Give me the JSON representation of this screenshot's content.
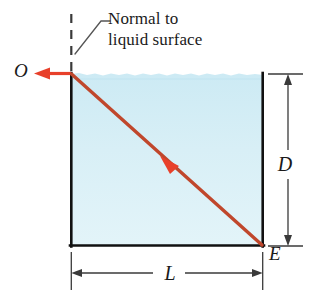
{
  "figure": {
    "annotation": {
      "line1": "Normal to",
      "line2": "liquid surface"
    },
    "points": {
      "origin_label": "O",
      "bottom_corner_label": "E"
    },
    "dimensions": {
      "depth_label": "D",
      "length_label": "L"
    },
    "colors": {
      "ray": "#C0472C",
      "arrow": "#E8402A",
      "liquid": "#D6EEF5",
      "container": "#111111",
      "dimension_line": "#3a3a3a",
      "background": "#FFFFFF"
    },
    "geometry": {
      "box_left": 71,
      "box_right": 263,
      "box_top": 74,
      "box_bottom": 246,
      "normal_dash_top": 14,
      "ray_mid_arrow_x": 168,
      "ray_mid_arrow_y": 163,
      "exit_arrow_tip_x": 36
    }
  }
}
